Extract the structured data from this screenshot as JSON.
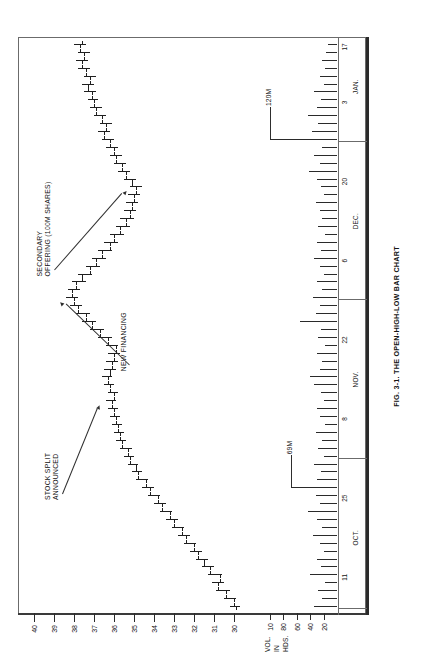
{
  "figure": {
    "caption": "FIG. 3-1. THE OPEN-HIGH-LOW BAR CHART",
    "rotation": "-90deg"
  },
  "chart_data": {
    "type": "bar",
    "title": "FIG. 3-1. THE OPEN-HIGH-LOW BAR CHART",
    "subtitle": "",
    "xlabel": "",
    "ylabel": "",
    "grid": false,
    "legend_position": "none",
    "price_axis": {
      "label": "",
      "ticks": [
        40,
        39,
        38,
        37,
        36,
        35,
        34,
        33,
        32,
        31,
        30
      ],
      "tick_labels": [
        "40",
        "39",
        "38",
        "37",
        "36",
        "35",
        "34",
        "33",
        "32",
        "31",
        "30"
      ],
      "ylim": [
        29.2,
        40.6
      ]
    },
    "volume_axis": {
      "label_lines": [
        "VOL.",
        "IN",
        "HDS."
      ],
      "ticks": [
        100,
        80,
        60,
        40,
        20
      ],
      "tick_labels": [
        "10",
        "80",
        "60",
        "40",
        "20"
      ],
      "ylim": [
        0,
        112
      ]
    },
    "date_axis": {
      "months": [
        "OCT.",
        "NOV.",
        "DEC.",
        "JAN."
      ],
      "tick_labels": [
        "11",
        "25",
        "8",
        "22",
        "6",
        "20",
        "3",
        "17"
      ]
    },
    "annotations": [
      {
        "text": "STOCK SPLIT\nANNOUNCED",
        "lines": [
          "STOCK SPLIT",
          "ANNOUNCED"
        ]
      },
      {
        "text": "NEW FINANCING",
        "lines": [
          "NEW FINANCING"
        ]
      },
      {
        "text": "SECONDARY\nOFFERING (100M SHARES)",
        "lines": [
          "SECONDARY",
          "OFFERING (100M SHARES)"
        ]
      },
      {
        "text": "69M",
        "lines": [
          "69M"
        ]
      },
      {
        "text": "120M",
        "lines": [
          "120M"
        ]
      }
    ],
    "ohlc": [
      {
        "x": 0,
        "open": 29.9,
        "high": 30.2,
        "low": 29.7,
        "close": 30.0
      },
      {
        "x": 1,
        "open": 30.0,
        "high": 30.5,
        "low": 29.9,
        "close": 30.4
      },
      {
        "x": 2,
        "open": 30.4,
        "high": 30.9,
        "low": 30.2,
        "close": 30.8
      },
      {
        "x": 3,
        "open": 30.8,
        "high": 31.1,
        "low": 30.5,
        "close": 30.7
      },
      {
        "x": 4,
        "open": 30.7,
        "high": 31.3,
        "low": 30.6,
        "close": 31.2
      },
      {
        "x": 5,
        "open": 31.2,
        "high": 31.6,
        "low": 31.0,
        "close": 31.5
      },
      {
        "x": 6,
        "open": 31.5,
        "high": 31.9,
        "low": 31.3,
        "close": 31.8
      },
      {
        "x": 7,
        "open": 31.8,
        "high": 32.2,
        "low": 31.6,
        "close": 32.0
      },
      {
        "x": 8,
        "open": 32.0,
        "high": 32.5,
        "low": 31.9,
        "close": 32.4
      },
      {
        "x": 9,
        "open": 32.4,
        "high": 32.8,
        "low": 32.2,
        "close": 32.6
      },
      {
        "x": 10,
        "open": 32.6,
        "high": 33.1,
        "low": 32.5,
        "close": 33.0
      },
      {
        "x": 11,
        "open": 33.0,
        "high": 33.4,
        "low": 32.8,
        "close": 33.2
      },
      {
        "x": 12,
        "open": 33.2,
        "high": 33.7,
        "low": 33.1,
        "close": 33.6
      },
      {
        "x": 13,
        "open": 33.6,
        "high": 34.0,
        "low": 33.4,
        "close": 33.8
      },
      {
        "x": 14,
        "open": 33.8,
        "high": 34.3,
        "low": 33.7,
        "close": 34.2
      },
      {
        "x": 15,
        "open": 34.2,
        "high": 34.6,
        "low": 34.0,
        "close": 34.4
      },
      {
        "x": 16,
        "open": 34.4,
        "high": 34.9,
        "low": 34.3,
        "close": 34.8
      },
      {
        "x": 17,
        "open": 34.8,
        "high": 35.1,
        "low": 34.6,
        "close": 34.9
      },
      {
        "x": 18,
        "open": 34.9,
        "high": 35.3,
        "low": 34.8,
        "close": 35.2
      },
      {
        "x": 19,
        "open": 35.2,
        "high": 35.5,
        "low": 35.0,
        "close": 35.3
      },
      {
        "x": 20,
        "open": 35.3,
        "high": 35.7,
        "low": 35.1,
        "close": 35.6
      },
      {
        "x": 21,
        "open": 35.6,
        "high": 35.9,
        "low": 35.4,
        "close": 35.7
      },
      {
        "x": 22,
        "open": 35.7,
        "high": 36.0,
        "low": 35.5,
        "close": 35.8
      },
      {
        "x": 23,
        "open": 35.8,
        "high": 36.1,
        "low": 35.6,
        "close": 35.9
      },
      {
        "x": 24,
        "open": 35.9,
        "high": 36.2,
        "low": 35.7,
        "close": 36.0
      },
      {
        "x": 25,
        "open": 36.0,
        "high": 36.3,
        "low": 35.8,
        "close": 36.1
      },
      {
        "x": 26,
        "open": 36.1,
        "high": 36.4,
        "low": 35.9,
        "close": 36.0
      },
      {
        "x": 27,
        "open": 36.0,
        "high": 36.3,
        "low": 35.8,
        "close": 36.2
      },
      {
        "x": 28,
        "open": 36.2,
        "high": 36.5,
        "low": 36.0,
        "close": 36.3
      },
      {
        "x": 29,
        "open": 36.3,
        "high": 36.6,
        "low": 36.1,
        "close": 36.2
      },
      {
        "x": 30,
        "open": 36.2,
        "high": 36.5,
        "low": 35.9,
        "close": 36.1
      },
      {
        "x": 31,
        "open": 36.1,
        "high": 36.4,
        "low": 35.8,
        "close": 36.0
      },
      {
        "x": 32,
        "open": 36.0,
        "high": 36.3,
        "low": 35.7,
        "close": 35.9
      },
      {
        "x": 33,
        "open": 35.9,
        "high": 36.4,
        "low": 35.8,
        "close": 36.3
      },
      {
        "x": 34,
        "open": 36.3,
        "high": 36.8,
        "low": 36.1,
        "close": 36.7
      },
      {
        "x": 35,
        "open": 36.7,
        "high": 37.2,
        "low": 36.5,
        "close": 37.1
      },
      {
        "x": 36,
        "open": 37.1,
        "high": 37.6,
        "low": 36.9,
        "close": 37.4
      },
      {
        "x": 37,
        "open": 37.4,
        "high": 37.9,
        "low": 37.2,
        "close": 37.8
      },
      {
        "x": 38,
        "open": 37.8,
        "high": 38.2,
        "low": 37.6,
        "close": 38.0
      },
      {
        "x": 39,
        "open": 38.0,
        "high": 38.4,
        "low": 37.8,
        "close": 38.1
      },
      {
        "x": 40,
        "open": 38.1,
        "high": 38.3,
        "low": 37.7,
        "close": 37.9
      },
      {
        "x": 41,
        "open": 37.9,
        "high": 38.1,
        "low": 37.4,
        "close": 37.6
      },
      {
        "x": 42,
        "open": 37.6,
        "high": 37.8,
        "low": 37.1,
        "close": 37.2
      },
      {
        "x": 43,
        "open": 37.2,
        "high": 37.4,
        "low": 36.7,
        "close": 36.9
      },
      {
        "x": 44,
        "open": 36.9,
        "high": 37.1,
        "low": 36.4,
        "close": 36.6
      },
      {
        "x": 45,
        "open": 36.6,
        "high": 36.8,
        "low": 36.1,
        "close": 36.2
      },
      {
        "x": 46,
        "open": 36.2,
        "high": 36.5,
        "low": 35.8,
        "close": 36.0
      },
      {
        "x": 47,
        "open": 36.0,
        "high": 36.2,
        "low": 35.5,
        "close": 35.7
      },
      {
        "x": 48,
        "open": 35.7,
        "high": 35.9,
        "low": 35.2,
        "close": 35.4
      },
      {
        "x": 49,
        "open": 35.4,
        "high": 35.7,
        "low": 35.0,
        "close": 35.2
      },
      {
        "x": 50,
        "open": 35.2,
        "high": 35.5,
        "low": 34.9,
        "close": 35.1
      },
      {
        "x": 51,
        "open": 35.1,
        "high": 35.4,
        "low": 34.8,
        "close": 35.0
      },
      {
        "x": 52,
        "open": 35.0,
        "high": 35.3,
        "low": 34.7,
        "close": 34.9
      },
      {
        "x": 53,
        "open": 34.9,
        "high": 35.2,
        "low": 34.6,
        "close": 35.1
      },
      {
        "x": 54,
        "open": 35.1,
        "high": 35.5,
        "low": 34.9,
        "close": 35.4
      },
      {
        "x": 55,
        "open": 35.4,
        "high": 35.8,
        "low": 35.2,
        "close": 35.6
      },
      {
        "x": 56,
        "open": 35.6,
        "high": 36.0,
        "low": 35.4,
        "close": 35.9
      },
      {
        "x": 57,
        "open": 35.9,
        "high": 36.2,
        "low": 35.6,
        "close": 36.0
      },
      {
        "x": 58,
        "open": 36.0,
        "high": 36.4,
        "low": 35.8,
        "close": 36.2
      },
      {
        "x": 59,
        "open": 36.2,
        "high": 36.6,
        "low": 36.0,
        "close": 36.5
      },
      {
        "x": 60,
        "open": 36.5,
        "high": 36.8,
        "low": 36.2,
        "close": 36.4
      },
      {
        "x": 61,
        "open": 36.4,
        "high": 36.7,
        "low": 36.1,
        "close": 36.6
      },
      {
        "x": 62,
        "open": 36.6,
        "high": 37.0,
        "low": 36.4,
        "close": 36.9
      },
      {
        "x": 63,
        "open": 36.9,
        "high": 37.2,
        "low": 36.6,
        "close": 37.0
      },
      {
        "x": 64,
        "open": 37.0,
        "high": 37.3,
        "low": 36.8,
        "close": 37.1
      },
      {
        "x": 65,
        "open": 37.1,
        "high": 37.5,
        "low": 36.9,
        "close": 37.3
      },
      {
        "x": 66,
        "open": 37.3,
        "high": 37.6,
        "low": 37.0,
        "close": 37.2
      },
      {
        "x": 67,
        "open": 37.2,
        "high": 37.5,
        "low": 36.9,
        "close": 37.4
      },
      {
        "x": 68,
        "open": 37.4,
        "high": 37.8,
        "low": 37.2,
        "close": 37.6
      },
      {
        "x": 69,
        "open": 37.6,
        "high": 37.9,
        "low": 37.3,
        "close": 37.5
      },
      {
        "x": 70,
        "open": 37.5,
        "high": 37.8,
        "low": 37.2,
        "close": 37.7
      },
      {
        "x": 71,
        "open": 37.7,
        "high": 38.0,
        "low": 37.4,
        "close": 37.6
      }
    ],
    "volume": [
      {
        "x": 0,
        "v": 34
      },
      {
        "x": 1,
        "v": 22
      },
      {
        "x": 2,
        "v": 28
      },
      {
        "x": 3,
        "v": 18
      },
      {
        "x": 4,
        "v": 40
      },
      {
        "x": 5,
        "v": 24
      },
      {
        "x": 6,
        "v": 30
      },
      {
        "x": 7,
        "v": 20
      },
      {
        "x": 8,
        "v": 26
      },
      {
        "x": 9,
        "v": 36
      },
      {
        "x": 10,
        "v": 22
      },
      {
        "x": 11,
        "v": 30
      },
      {
        "x": 12,
        "v": 44
      },
      {
        "x": 13,
        "v": 26
      },
      {
        "x": 14,
        "v": 32
      },
      {
        "x": 15,
        "v": 69
      },
      {
        "x": 16,
        "v": 30
      },
      {
        "x": 17,
        "v": 24
      },
      {
        "x": 18,
        "v": 34
      },
      {
        "x": 19,
        "v": 20
      },
      {
        "x": 20,
        "v": 28
      },
      {
        "x": 21,
        "v": 22
      },
      {
        "x": 22,
        "v": 32
      },
      {
        "x": 23,
        "v": 18
      },
      {
        "x": 24,
        "v": 26
      },
      {
        "x": 25,
        "v": 30
      },
      {
        "x": 26,
        "v": 20
      },
      {
        "x": 27,
        "v": 24
      },
      {
        "x": 28,
        "v": 34
      },
      {
        "x": 29,
        "v": 40
      },
      {
        "x": 30,
        "v": 26
      },
      {
        "x": 31,
        "v": 22
      },
      {
        "x": 32,
        "v": 30
      },
      {
        "x": 33,
        "v": 18
      },
      {
        "x": 34,
        "v": 28
      },
      {
        "x": 35,
        "v": 24
      },
      {
        "x": 36,
        "v": 56
      },
      {
        "x": 37,
        "v": 32
      },
      {
        "x": 38,
        "v": 26
      },
      {
        "x": 39,
        "v": 36
      },
      {
        "x": 40,
        "v": 22
      },
      {
        "x": 41,
        "v": 30
      },
      {
        "x": 42,
        "v": 20
      },
      {
        "x": 43,
        "v": 26
      },
      {
        "x": 44,
        "v": 34
      },
      {
        "x": 45,
        "v": 24
      },
      {
        "x": 46,
        "v": 30
      },
      {
        "x": 47,
        "v": 18
      },
      {
        "x": 48,
        "v": 28
      },
      {
        "x": 49,
        "v": 22
      },
      {
        "x": 50,
        "v": 26
      },
      {
        "x": 51,
        "v": 32
      },
      {
        "x": 52,
        "v": 20
      },
      {
        "x": 53,
        "v": 24
      },
      {
        "x": 54,
        "v": 30
      },
      {
        "x": 55,
        "v": 42
      },
      {
        "x": 56,
        "v": 26
      },
      {
        "x": 57,
        "v": 34
      },
      {
        "x": 58,
        "v": 22
      },
      {
        "x": 59,
        "v": 100
      },
      {
        "x": 60,
        "v": 38
      },
      {
        "x": 61,
        "v": 28
      },
      {
        "x": 62,
        "v": 44
      },
      {
        "x": 63,
        "v": 30
      },
      {
        "x": 64,
        "v": 24
      },
      {
        "x": 65,
        "v": 34
      },
      {
        "x": 66,
        "v": 20
      },
      {
        "x": 67,
        "v": 26
      },
      {
        "x": 68,
        "v": 18
      },
      {
        "x": 69,
        "v": 22
      },
      {
        "x": 70,
        "v": 16
      },
      {
        "x": 71,
        "v": 14
      }
    ]
  }
}
